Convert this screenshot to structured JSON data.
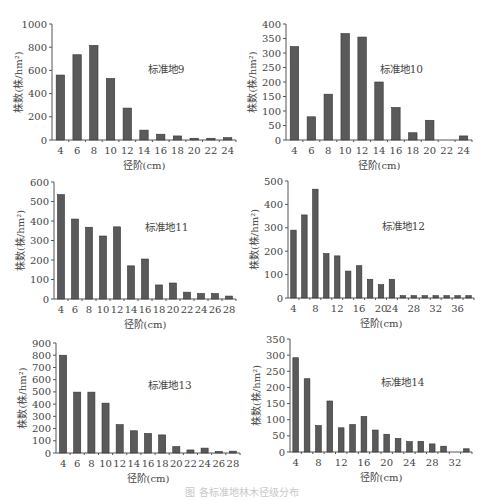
{
  "chart_data": [
    {
      "type": "bar",
      "title": "标准地9",
      "xlabel": "径阶(cm)",
      "ylabel": "株数(株/hm²)",
      "ylim": [
        0,
        1000
      ],
      "yticks": [
        0,
        200,
        400,
        600,
        800,
        1000
      ],
      "categories": [
        "4",
        "6",
        "8",
        "10",
        "12",
        "14",
        "16",
        "18",
        "20",
        "22",
        "24"
      ],
      "xtick_labels": [
        "4",
        "6",
        "8",
        "10",
        "12",
        "14",
        "16",
        "18",
        "20",
        "22",
        "24"
      ],
      "values": [
        560,
        735,
        815,
        530,
        275,
        85,
        50,
        35,
        15,
        15,
        20
      ],
      "grid": false
    },
    {
      "type": "bar",
      "title": "标准地10",
      "xlabel": "径阶(cm)",
      "ylabel": "株数(株/hm²)",
      "ylim": [
        0,
        400
      ],
      "yticks": [
        0,
        50,
        100,
        150,
        200,
        250,
        300,
        350,
        400
      ],
      "categories": [
        "4",
        "6",
        "8",
        "10",
        "12",
        "14",
        "16",
        "18",
        "20",
        "22",
        "24"
      ],
      "xtick_labels": [
        "4",
        "6",
        "8",
        "10",
        "12",
        "14",
        "16",
        "18",
        "20",
        "22",
        "24"
      ],
      "values": [
        322,
        80,
        158,
        367,
        355,
        200,
        112,
        25,
        68,
        0,
        14
      ],
      "grid": false
    },
    {
      "type": "bar",
      "title": "标准地11",
      "xlabel": "径阶(cm)",
      "ylabel": "株数(株/hm²)",
      "ylim": [
        0,
        600
      ],
      "yticks": [
        0,
        100,
        200,
        300,
        400,
        500,
        600
      ],
      "categories": [
        "4",
        "6",
        "8",
        "10",
        "12",
        "14",
        "16",
        "18",
        "20",
        "22",
        "24",
        "26",
        "28"
      ],
      "xtick_labels": [
        "4",
        "6",
        "8",
        "10",
        "12",
        "14",
        "16",
        "18",
        "20",
        "22",
        "24",
        "26",
        "28"
      ],
      "values": [
        535,
        410,
        368,
        323,
        370,
        170,
        205,
        72,
        82,
        35,
        28,
        28,
        15
      ],
      "grid": false
    },
    {
      "type": "bar",
      "title": "标准地12",
      "xlabel": "径阶(cm)",
      "ylabel": "株数(株/hm²)",
      "ylim": [
        0,
        500
      ],
      "yticks": [
        0,
        100,
        200,
        300,
        400,
        500
      ],
      "categories": [
        "4",
        "6",
        "8",
        "10",
        "12",
        "14",
        "16",
        "18",
        "20",
        "22",
        "24",
        "26",
        "28",
        "30",
        "32",
        "34",
        "36"
      ],
      "xtick_labels": [
        "4",
        "8",
        "12",
        "16",
        "20",
        "24",
        "28",
        "32",
        "36"
      ],
      "values": [
        290,
        355,
        465,
        190,
        180,
        115,
        138,
        80,
        57,
        80,
        10,
        10,
        10,
        10,
        10,
        10,
        10
      ],
      "grid": false
    },
    {
      "type": "bar",
      "title": "标准地13",
      "xlabel": "径阶(cm)",
      "ylabel": "株数(株/hm²)",
      "ylim": [
        0,
        900
      ],
      "yticks": [
        0,
        100,
        200,
        300,
        400,
        500,
        600,
        700,
        800,
        900
      ],
      "categories": [
        "4",
        "6",
        "8",
        "10",
        "12",
        "14",
        "16",
        "18",
        "20",
        "22",
        "24",
        "26",
        "28"
      ],
      "xtick_labels": [
        "4",
        "6",
        "8",
        "10",
        "12",
        "14",
        "16",
        "18",
        "20",
        "22",
        "24",
        "26",
        "28"
      ],
      "values": [
        800,
        498,
        498,
        408,
        232,
        182,
        160,
        148,
        52,
        25,
        40,
        12,
        15
      ],
      "grid": false
    },
    {
      "type": "bar",
      "title": "标准地14",
      "xlabel": "径阶(cm)",
      "ylabel": "株数(株/hm²)",
      "ylim": [
        0,
        350
      ],
      "yticks": [
        0,
        50,
        100,
        150,
        200,
        250,
        300,
        350
      ],
      "categories": [
        "4",
        "6",
        "8",
        "10",
        "12",
        "14",
        "16",
        "18",
        "20",
        "22",
        "24",
        "26",
        "28",
        "30",
        "32",
        "34"
      ],
      "xtick_labels": [
        "4",
        "8",
        "12",
        "16",
        "20",
        "24",
        "28",
        "32"
      ],
      "values": [
        292,
        227,
        82,
        158,
        75,
        85,
        110,
        68,
        55,
        42,
        32,
        33,
        25,
        18,
        0,
        10
      ],
      "grid": false
    }
  ],
  "caption": "图 各标准地林木径级分布"
}
